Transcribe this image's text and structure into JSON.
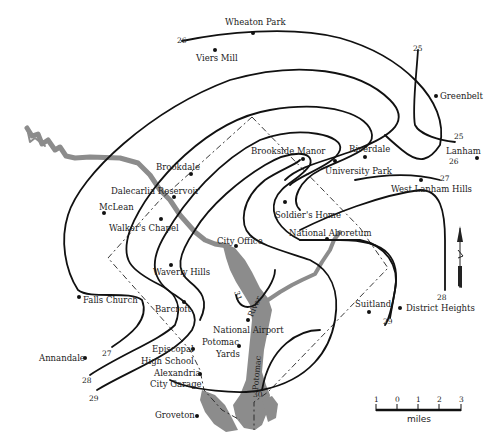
{
  "map": {
    "colors": {
      "contour": "#111111",
      "river": "#8c8c8c",
      "boundary": "#222222",
      "background": "#ffffff"
    },
    "places": [
      {
        "name": "Wheaton Park",
        "lx": 225,
        "ly": 18,
        "dx": 253,
        "dy": 33
      },
      {
        "name": "Viers Mill",
        "lx": 196,
        "ly": 54,
        "dx": 215,
        "dy": 50
      },
      {
        "name": "Greenbelt",
        "lx": 440,
        "ly": 93,
        "dx": 436,
        "dy": 96
      },
      {
        "name": "Lanham",
        "lx": 447,
        "ly": 148,
        "dx": 477,
        "dy": 158
      },
      {
        "name": "Riverdale",
        "lx": 349,
        "ly": 145,
        "dx": 365,
        "dy": 157
      },
      {
        "name": "University Park",
        "lx": 325,
        "ly": 167,
        "dx": 335,
        "dy": 161
      },
      {
        "name": "Brookside Manor",
        "lx": 251,
        "ly": 147,
        "dx": 303,
        "dy": 159
      },
      {
        "name": "West Lanham Hills",
        "lx": 391,
        "ly": 185,
        "dx": 421,
        "dy": 180
      },
      {
        "name": "Brookdale",
        "lx": 156,
        "ly": 163,
        "dx": 191,
        "dy": 174
      },
      {
        "name": "Dalecarlia Reservoir",
        "lx": 111,
        "ly": 187,
        "dx": 174,
        "dy": 197
      },
      {
        "name": "McLean",
        "lx": 99,
        "ly": 204,
        "dx": 104,
        "dy": 213
      },
      {
        "name": "Walker's Chapel",
        "lx": 109,
        "ly": 224,
        "dx": 161,
        "dy": 219
      },
      {
        "name": "Soldier's Home",
        "lx": 275,
        "ly": 211,
        "dx": 285,
        "dy": 202
      },
      {
        "name": "National Aboretum",
        "lx": 289,
        "ly": 229,
        "dx": 327,
        "dy": 239
      },
      {
        "name": "City Office",
        "lx": 217,
        "ly": 237,
        "dx": 236,
        "dy": 246
      },
      {
        "name": "Waverly Hills",
        "lx": 153,
        "ly": 268,
        "dx": 171,
        "dy": 265
      },
      {
        "name": "Falls Church",
        "lx": 83,
        "ly": 297,
        "dx": 79,
        "dy": 297
      },
      {
        "name": "Barcroft",
        "lx": 155,
        "ly": 305,
        "dx": 184,
        "dy": 302
      },
      {
        "name": "Suitland",
        "lx": 355,
        "ly": 300,
        "dx": 369,
        "dy": 312
      },
      {
        "name": "District Heights",
        "lx": 406,
        "ly": 305,
        "dx": 400,
        "dy": 308
      },
      {
        "name": "National Airport",
        "lx": 213,
        "ly": 326,
        "dx": 248,
        "dy": 320
      },
      {
        "name": "Potomac",
        "lx": 202,
        "ly": 339,
        "dx": 239,
        "dy": 346
      },
      {
        "name": "Yards",
        "lx": 216,
        "ly": 351,
        "dx": null,
        "dy": null
      },
      {
        "name": "Episcopal",
        "lx": 152,
        "ly": 346,
        "dx": 193,
        "dy": 349
      },
      {
        "name": "High School",
        "lx": 141,
        "ly": 358,
        "dx": null,
        "dy": null
      },
      {
        "name": "Annandale",
        "lx": 39,
        "ly": 355,
        "dx": 85,
        "dy": 358
      },
      {
        "name": "Alexandria",
        "lx": 154,
        "ly": 370,
        "dx": 200,
        "dy": 374
      },
      {
        "name": "City Garage",
        "lx": 150,
        "ly": 381,
        "dx": null,
        "dy": null
      },
      {
        "name": "Groveton",
        "lx": 155,
        "ly": 411,
        "dx": 197,
        "dy": 416
      }
    ],
    "contour_labels": [
      {
        "value": "26",
        "x": 177,
        "y": 38
      },
      {
        "value": "25",
        "x": 412,
        "y": 46
      },
      {
        "value": "25",
        "x": 454,
        "y": 133
      },
      {
        "value": "26",
        "x": 449,
        "y": 158
      },
      {
        "value": "27",
        "x": 440,
        "y": 175
      },
      {
        "value": "28",
        "x": 437,
        "y": 294
      },
      {
        "value": "29",
        "x": 383,
        "y": 318
      },
      {
        "value": "27",
        "x": 102,
        "y": 350
      },
      {
        "value": "28",
        "x": 82,
        "y": 377
      },
      {
        "value": "29",
        "x": 89,
        "y": 395
      },
      {
        "value": "30",
        "x": 253,
        "y": 391
      },
      {
        "value": "31",
        "x": 233,
        "y": 293
      }
    ],
    "river_labels": [
      {
        "text": "River",
        "x": 247,
        "y": 320,
        "rotate": -65
      },
      {
        "text": "Potomac",
        "x": 245,
        "y": 368,
        "rotate": -85
      }
    ],
    "scale_bar": {
      "ticks": [
        "1",
        "0",
        "1",
        "2",
        "3"
      ],
      "unit": "miles"
    }
  }
}
